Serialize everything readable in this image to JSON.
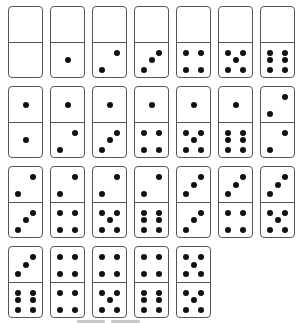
{
  "game": {
    "type": "domino-set",
    "pip_color": "#111111",
    "border_color": "#555555",
    "rows": [
      [
        [
          0,
          0
        ],
        [
          0,
          1
        ],
        [
          0,
          2
        ],
        [
          0,
          3
        ],
        [
          0,
          4
        ],
        [
          0,
          5
        ],
        [
          0,
          6
        ]
      ],
      [
        [
          1,
          1
        ],
        [
          1,
          2
        ],
        [
          1,
          3
        ],
        [
          1,
          4
        ],
        [
          1,
          5
        ],
        [
          1,
          6
        ],
        [
          2,
          2
        ]
      ],
      [
        [
          2,
          3
        ],
        [
          2,
          4
        ],
        [
          2,
          5
        ],
        [
          2,
          6
        ],
        [
          3,
          3
        ],
        [
          3,
          4
        ],
        [
          3,
          5
        ]
      ],
      [
        [
          3,
          6
        ],
        [
          4,
          4
        ],
        [
          4,
          5
        ],
        [
          4,
          6
        ],
        [
          5,
          5
        ]
      ]
    ]
  },
  "scroll_indicators": [
    {
      "left": 77,
      "width": 28
    },
    {
      "left": 111,
      "width": 29
    }
  ]
}
